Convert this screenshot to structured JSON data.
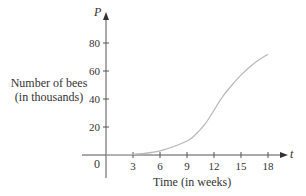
{
  "chart_data": {
    "type": "line",
    "title": "",
    "xlabel": "Time (in weeks)",
    "ylabel": "Number of bees (in thousands)",
    "x_axis_symbol": "t",
    "y_axis_symbol": "P",
    "origin_label": "0",
    "x_ticks": [
      3,
      6,
      9,
      12,
      15,
      18
    ],
    "y_ticks": [
      20,
      40,
      60,
      80
    ],
    "xlim": [
      0,
      19
    ],
    "ylim": [
      0,
      85
    ],
    "grid": false,
    "series": [
      {
        "name": "P(t)",
        "x": [
          0,
          3,
          6,
          9,
          10,
          11,
          12,
          13,
          14,
          15,
          16,
          17,
          18
        ],
        "values": [
          0,
          0.5,
          3,
          10,
          15,
          22,
          32,
          42,
          50,
          57,
          63,
          68,
          72
        ]
      }
    ],
    "colors": {
      "curve": "#b8b8b8",
      "axis": "#555555"
    }
  },
  "labels": {
    "ylabel_line1": "Number of bees",
    "ylabel_line2": "(in thousands)",
    "xlabel": "Time (in weeks)",
    "x_symbol": "t",
    "y_symbol": "P",
    "origin": "0",
    "x_ticks": [
      "3",
      "6",
      "9",
      "12",
      "15",
      "18"
    ],
    "y_ticks": [
      "20",
      "40",
      "60",
      "80"
    ]
  }
}
